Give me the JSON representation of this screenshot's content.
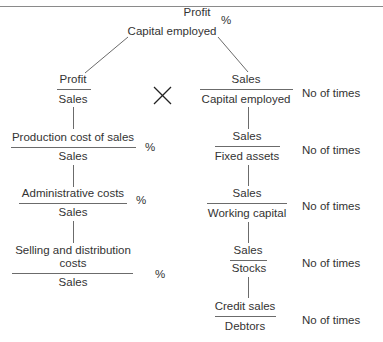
{
  "diagram": {
    "top": {
      "numerator": "Profit",
      "denominator": "Capital employed",
      "unit": "%"
    },
    "operator": "×",
    "left_branch": [
      {
        "numerator": "Profit",
        "denominator": "Sales",
        "unit": ""
      },
      {
        "numerator": "Production cost of sales",
        "denominator": "Sales",
        "unit": "%"
      },
      {
        "numerator": "Administrative costs",
        "denominator": "Sales",
        "unit": "%"
      },
      {
        "numerator_line1": "Selling and distribution",
        "numerator_line2": "costs",
        "denominator": "Sales",
        "unit": "%"
      }
    ],
    "right_branch": [
      {
        "numerator": "Sales",
        "denominator": "Capital employed",
        "unit": "No of times"
      },
      {
        "numerator": "Sales",
        "denominator": "Fixed assets",
        "unit": "No of times"
      },
      {
        "numerator": "Sales",
        "denominator": "Working capital",
        "unit": "No of times"
      },
      {
        "numerator": "Sales",
        "denominator": "Stocks",
        "unit": "No of times"
      },
      {
        "numerator": "Credit sales",
        "denominator": "Debtors",
        "unit": "No of times"
      }
    ],
    "colors": {
      "text": "#333333",
      "lines": "#6b6b6b",
      "background": "#ffffff"
    }
  }
}
